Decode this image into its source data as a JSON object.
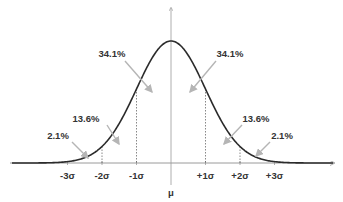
{
  "chart_data": {
    "type": "line",
    "title": "",
    "xlabel": "μ",
    "ylabel": "",
    "xlim": [
      -4.6,
      4.8
    ],
    "mean_label": "μ",
    "tick_labels": [
      {
        "x": -3,
        "label": "-3σ"
      },
      {
        "x": -2,
        "label": "-2σ"
      },
      {
        "x": -1,
        "label": "-1σ"
      },
      {
        "x": 1,
        "label": "+1σ"
      },
      {
        "x": 2,
        "label": "+2σ"
      },
      {
        "x": 3,
        "label": "+3σ"
      }
    ],
    "sigma_dividers": [
      -2,
      -1,
      1,
      2
    ],
    "regions": [
      {
        "from": -3,
        "to": -2,
        "label": "2.1%",
        "value": 2.1
      },
      {
        "from": -2,
        "to": -1,
        "label": "13.6%",
        "value": 13.6
      },
      {
        "from": -1,
        "to": 0,
        "label": "34.1%",
        "value": 34.1
      },
      {
        "from": 0,
        "to": 1,
        "label": "34.1%",
        "value": 34.1
      },
      {
        "from": 1,
        "to": 2,
        "label": "13.6%",
        "value": 13.6
      },
      {
        "from": 2,
        "to": 3,
        "label": "2.1%",
        "value": 2.1
      }
    ],
    "colors": {
      "curve": "#2b2b2b",
      "axis": "#9a9a9a",
      "arrow": "#b5b5b5",
      "divider": "#555555",
      "text": "#333333"
    }
  }
}
